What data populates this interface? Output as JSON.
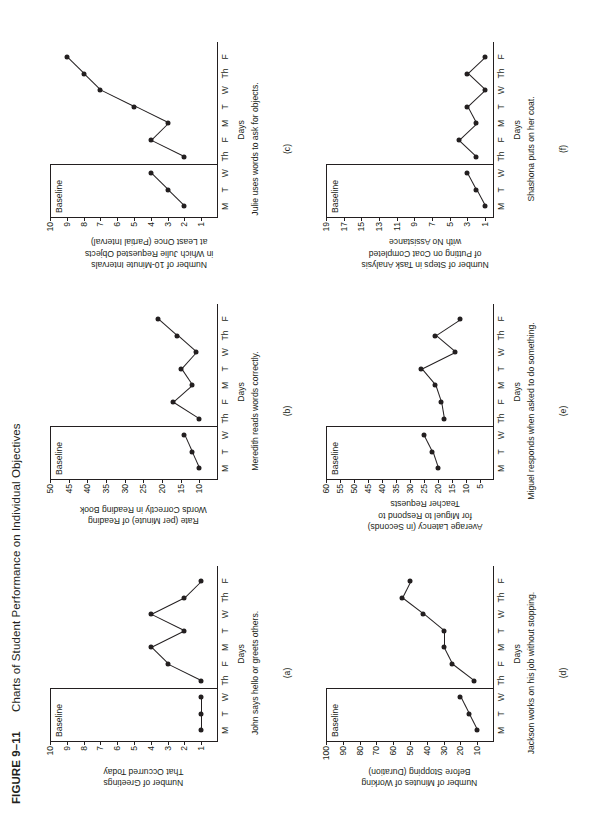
{
  "figure": {
    "number": "FIGURE 9–11",
    "title": "Charts of Student Performance on Individual Objectives"
  },
  "common": {
    "baseline_label": "Baseline",
    "xlabel": "Days",
    "day_labels": [
      "M",
      "T",
      "W",
      "Th",
      "F",
      "M",
      "T",
      "W",
      "Th",
      "F"
    ]
  },
  "chart_data": [
    {
      "type": "line",
      "panel": "(a)",
      "title": "",
      "ylabel": "Number of Greetings That Occurred Today",
      "ylabel_lines": [
        "Number of Greetings",
        "That Occurred Today"
      ],
      "xlabel": "Days",
      "caption": "John says hello or greets others.",
      "categories": [
        "M",
        "T",
        "W",
        "Th",
        "F",
        "M",
        "T",
        "W",
        "Th",
        "F"
      ],
      "yticks": [
        1,
        2,
        3,
        4,
        5,
        6,
        7,
        8,
        9,
        10
      ],
      "ylim": [
        0,
        10
      ],
      "baseline_label": "Baseline",
      "phase_split_after": 3,
      "values": [
        1,
        1,
        1,
        1,
        3,
        4,
        2,
        4,
        2,
        1
      ]
    },
    {
      "type": "line",
      "panel": "(b)",
      "title": "",
      "ylabel": "Rate (per Minute) of Reading Words Correctly in Reading Book",
      "ylabel_lines": [
        "Rate (per Minute) of Reading",
        "Words Correctly  in Reading Book"
      ],
      "xlabel": "Days",
      "caption": "Meredith reads words correctly.",
      "categories": [
        "M",
        "T",
        "W",
        "Th",
        "F",
        "M",
        "T",
        "W",
        "Th",
        "F"
      ],
      "yticks": [
        10,
        15,
        20,
        25,
        30,
        35,
        40,
        45,
        50
      ],
      "ylim": [
        5,
        50
      ],
      "baseline_label": "Baseline",
      "phase_split_after": 3,
      "values": [
        10,
        12,
        14,
        10,
        17,
        12,
        15,
        11,
        16,
        21
      ]
    },
    {
      "type": "line",
      "panel": "(c)",
      "title": "",
      "ylabel": "Number of 10-Minute Intervals in Which Julie Requested Objects at Least Once (Partial Interval)",
      "ylabel_lines": [
        "Number of 10-Minute Intervals",
        "in Which Julie Requested Objects",
        "at Least Once (Partial Interval)"
      ],
      "xlabel": "Days",
      "caption": "Julie uses words to ask for objects.",
      "categories": [
        "M",
        "T",
        "W",
        "Th",
        "F",
        "M",
        "T",
        "W",
        "Th",
        "F"
      ],
      "yticks": [
        1,
        2,
        3,
        4,
        5,
        6,
        7,
        8,
        9,
        10
      ],
      "ylim": [
        0,
        10
      ],
      "baseline_label": "Baseline",
      "phase_split_after": 3,
      "values": [
        2,
        3,
        4,
        2,
        4,
        3,
        5,
        7,
        8,
        9
      ]
    },
    {
      "type": "line",
      "panel": "(d)",
      "title": "",
      "ylabel": "Number of Minutes of Working Before Stopping (Duration)",
      "ylabel_lines": [
        "Number of Minutes of Working",
        "Before Stopping (Duration)"
      ],
      "xlabel": "Days",
      "caption": "Jackson works on his job without stopping.",
      "categories": [
        "M",
        "T",
        "W",
        "Th",
        "F",
        "M",
        "T",
        "W",
        "Th",
        "F"
      ],
      "yticks": [
        10,
        20,
        30,
        40,
        50,
        60,
        70,
        80,
        90,
        100
      ],
      "ylim": [
        0,
        100
      ],
      "baseline_label": "Baseline",
      "phase_split_after": 3,
      "values": [
        10,
        15,
        20,
        12,
        25,
        30,
        30,
        42,
        55,
        50
      ]
    },
    {
      "type": "line",
      "panel": "(e)",
      "title": "",
      "ylabel": "Average Latency (in Seconds) for Miguel to Respond to Teacher Requests",
      "ylabel_lines": [
        "Average Latency (in Seconds)",
        "for Miguel to Respond to",
        "Teacher Requests"
      ],
      "xlabel": "Days",
      "caption": "Miguel responds when asked to do something.",
      "categories": [
        "M",
        "T",
        "W",
        "Th",
        "F",
        "M",
        "T",
        "W",
        "Th",
        "F"
      ],
      "yticks": [
        5,
        10,
        15,
        20,
        25,
        30,
        35,
        40,
        45,
        50,
        55,
        60
      ],
      "ylim": [
        0,
        60
      ],
      "baseline_label": "Baseline",
      "phase_split_after": 3,
      "values": [
        20,
        22,
        25,
        18,
        19,
        21,
        26,
        14,
        21,
        12
      ]
    },
    {
      "type": "line",
      "panel": "(f)",
      "title": "",
      "ylabel": "Number of Steps in Task Analysis of Putting on Coat Completed with No Assistance",
      "ylabel_lines": [
        "Number of Steps in Task Analysis",
        "of Putting on Coat Completed",
        "with No Assistance"
      ],
      "xlabel": "Days",
      "caption": "Shashona puts on her coat.",
      "categories": [
        "M",
        "T",
        "W",
        "Th",
        "F",
        "M",
        "T",
        "W",
        "Th",
        "F"
      ],
      "yticks": [
        1,
        3,
        5,
        7,
        9,
        11,
        13,
        15,
        17,
        19
      ],
      "ylim": [
        0,
        19
      ],
      "baseline_label": "Baseline",
      "phase_split_after": 3,
      "values": [
        1,
        2,
        3,
        2,
        4,
        2,
        3,
        1,
        3,
        1
      ]
    }
  ]
}
